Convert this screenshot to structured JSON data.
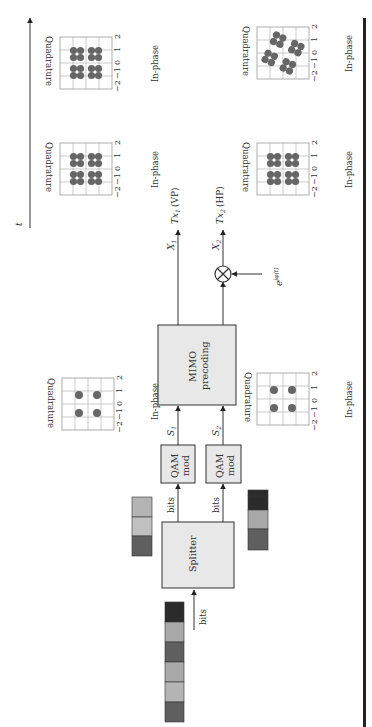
{
  "diagram": {
    "orientation": "rotated-90-ccw",
    "time_axis": {
      "label": "t"
    },
    "input": {
      "label": "bits",
      "bit_blocks": [
        "#5f5f5f",
        "#a9a9a9",
        "#a9a9a9",
        "#5f5f5f",
        "#a9a9a9",
        "#2b2b2b"
      ]
    },
    "splitter": {
      "label": "Splitter"
    },
    "branch1": {
      "bits_label": "bits",
      "bit_blocks": [
        "#5f5f5f",
        "#b4b4b4",
        "#a9a9a9"
      ],
      "qam_label_1": "QAM",
      "qam_label_2": "mod",
      "signal": "S",
      "signal_sub": "1"
    },
    "branch2": {
      "bits_label": "bits",
      "bit_blocks": [
        "#5f5f5f",
        "#a9a9a9",
        "#2b2b2b",
        "#2b2b2b"
      ],
      "qam_label_1": "QAM",
      "qam_label_2": "mod",
      "signal": "S",
      "signal_sub": "2"
    },
    "mimo": {
      "label_1": "MIMO",
      "label_2": "precoding"
    },
    "outputs": {
      "x1": "X",
      "x1_sub": "1",
      "x2": "X",
      "x2_sub": "2",
      "tx1": "Tx",
      "tx1_sub": "1",
      "tx1_pol": "(VP)",
      "tx2": "Tx",
      "tx2_sub": "2",
      "tx2_pol": "(HP)",
      "phase": "e",
      "phase_exp": "jφ(t)",
      "mixer_symbol": "⊗"
    },
    "constellation_axes": {
      "xlabel": "In-phase",
      "ylabel": "Quadrature",
      "ticks": [
        "−2",
        "−1",
        "0",
        "1",
        "2"
      ]
    },
    "constellations": [
      {
        "id": "s1",
        "type": "QPSK",
        "points": [
          [
            -0.7,
            0.7
          ],
          [
            0.7,
            0.7
          ],
          [
            -0.7,
            -0.7
          ],
          [
            0.7,
            -0.7
          ]
        ]
      },
      {
        "id": "s2",
        "type": "QPSK",
        "points": [
          [
            -0.7,
            0.7
          ],
          [
            0.7,
            0.7
          ],
          [
            -0.7,
            -0.7
          ],
          [
            0.7,
            -0.7
          ]
        ]
      },
      {
        "id": "tx1-a",
        "type": "16-point clusters"
      },
      {
        "id": "tx1-b",
        "type": "16-point clusters"
      },
      {
        "id": "tx2-a",
        "type": "16-point clusters"
      },
      {
        "id": "tx2-b",
        "type": "16-point clusters, rotated"
      }
    ],
    "colors": {
      "block_fill": "#e8e8e8",
      "stroke": "#333333",
      "dot": "#6a6a6a",
      "grid": "#999999"
    }
  }
}
